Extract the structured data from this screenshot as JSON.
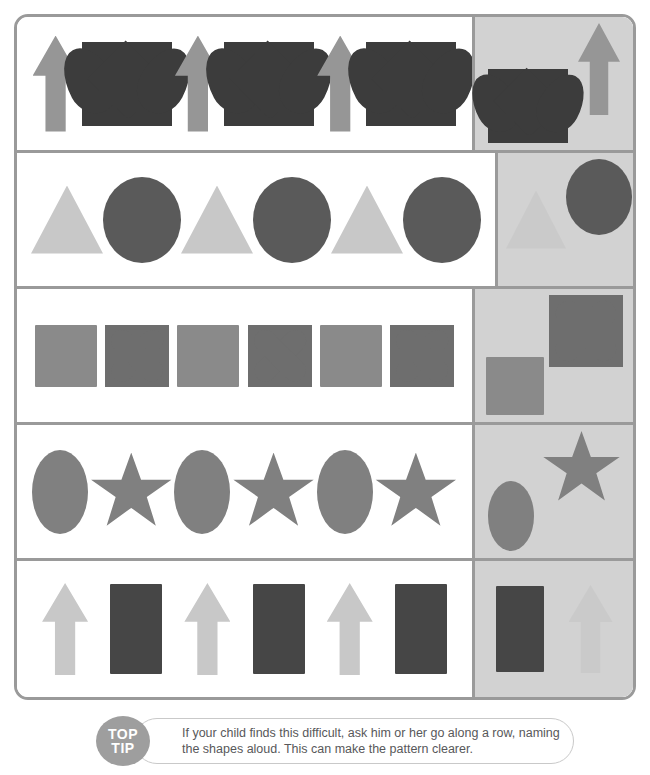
{
  "worksheet": {
    "title": "Complete the Pattern",
    "colors": {
      "border": "#9a9a9a",
      "answer_panel_bg": "#d2d2d2",
      "page_bg": "#ffffff",
      "tip_badge_bg": "#9e9e9e",
      "tip_text": "#58585a"
    },
    "rows": [
      {
        "id": "row-1",
        "pattern_name": "arrow-heart",
        "sequence": [
          {
            "shape": "arrow",
            "icon": "arrow-up-icon",
            "color": "#969696",
            "w": 46,
            "h": 96
          },
          {
            "shape": "heart",
            "icon": "heart-icon",
            "color": "#3c3c3c",
            "w": 90,
            "h": 84
          },
          {
            "shape": "arrow",
            "icon": "arrow-up-icon",
            "color": "#969696",
            "w": 46,
            "h": 96
          },
          {
            "shape": "heart",
            "icon": "heart-icon",
            "color": "#3c3c3c",
            "w": 90,
            "h": 84
          },
          {
            "shape": "arrow",
            "icon": "arrow-up-icon",
            "color": "#969696",
            "w": 46,
            "h": 96
          },
          {
            "shape": "heart",
            "icon": "heart-icon",
            "color": "#3c3c3c",
            "w": 90,
            "h": 84
          }
        ],
        "answers": [
          {
            "shape": "heart",
            "icon": "heart-icon",
            "color": "#3c3c3c",
            "w": 80,
            "h": 74,
            "ghost": false,
            "align": "flex-end"
          },
          {
            "shape": "arrow",
            "icon": "arrow-up-icon",
            "color": "#969696",
            "w": 42,
            "h": 92,
            "ghost": false,
            "align": "flex-start"
          }
        ]
      },
      {
        "id": "row-2",
        "pattern_name": "triangle-circle",
        "sequence": [
          {
            "shape": "triangle",
            "icon": "triangle-icon",
            "color": "#c8c8c8",
            "w": 72,
            "h": 68
          },
          {
            "shape": "circle",
            "icon": "circle-icon",
            "color": "#5a5a5a",
            "w": 78,
            "h": 86
          },
          {
            "shape": "triangle",
            "icon": "triangle-icon",
            "color": "#c8c8c8",
            "w": 72,
            "h": 68
          },
          {
            "shape": "circle",
            "icon": "circle-icon",
            "color": "#5a5a5a",
            "w": 78,
            "h": 86
          },
          {
            "shape": "triangle",
            "icon": "triangle-icon",
            "color": "#c8c8c8",
            "w": 72,
            "h": 68
          },
          {
            "shape": "circle",
            "icon": "circle-icon",
            "color": "#5a5a5a",
            "w": 78,
            "h": 86
          }
        ],
        "answers": [
          {
            "shape": "triangle",
            "icon": "triangle-icon",
            "color": "#8a8a8a",
            "w": 60,
            "h": 58,
            "ghost": true,
            "align": "center"
          },
          {
            "shape": "circle",
            "icon": "circle-icon",
            "color": "#5a5a5a",
            "w": 66,
            "h": 76,
            "ghost": false,
            "align": "flex-start"
          }
        ]
      },
      {
        "id": "row-3",
        "pattern_name": "square-cross",
        "sequence": [
          {
            "shape": "square",
            "icon": "square-icon",
            "color": "#8a8a8a",
            "w": 62,
            "h": 62
          },
          {
            "shape": "cross",
            "icon": "x-cross-icon",
            "color": "#6e6e6e",
            "w": 64,
            "h": 62
          },
          {
            "shape": "square",
            "icon": "square-icon",
            "color": "#8a8a8a",
            "w": 62,
            "h": 62
          },
          {
            "shape": "cross",
            "icon": "x-cross-icon",
            "color": "#6e6e6e",
            "w": 64,
            "h": 62
          },
          {
            "shape": "square",
            "icon": "square-icon",
            "color": "#8a8a8a",
            "w": 62,
            "h": 62
          },
          {
            "shape": "cross",
            "icon": "x-cross-icon",
            "color": "#6e6e6e",
            "w": 64,
            "h": 62
          }
        ],
        "answers": [
          {
            "shape": "square",
            "icon": "square-icon",
            "color": "#8a8a8a",
            "w": 58,
            "h": 58,
            "ghost": false,
            "align": "flex-end"
          },
          {
            "shape": "cross",
            "icon": "x-cross-icon",
            "color": "#6e6e6e",
            "w": 74,
            "h": 72,
            "ghost": false,
            "align": "flex-start"
          }
        ]
      },
      {
        "id": "row-4",
        "pattern_name": "oval-star",
        "sequence": [
          {
            "shape": "oval",
            "icon": "oval-icon",
            "color": "#808080",
            "w": 56,
            "h": 84
          },
          {
            "shape": "star",
            "icon": "star-icon",
            "color": "#808080",
            "w": 82,
            "h": 78
          },
          {
            "shape": "oval",
            "icon": "oval-icon",
            "color": "#808080",
            "w": 56,
            "h": 84
          },
          {
            "shape": "star",
            "icon": "star-icon",
            "color": "#808080",
            "w": 82,
            "h": 78
          },
          {
            "shape": "oval",
            "icon": "oval-icon",
            "color": "#808080",
            "w": 56,
            "h": 84
          },
          {
            "shape": "star",
            "icon": "star-icon",
            "color": "#808080",
            "w": 82,
            "h": 78
          }
        ],
        "answers": [
          {
            "shape": "oval",
            "icon": "oval-icon",
            "color": "#808080",
            "w": 46,
            "h": 70,
            "ghost": false,
            "align": "flex-end"
          },
          {
            "shape": "star",
            "icon": "star-icon",
            "color": "#808080",
            "w": 78,
            "h": 74,
            "ghost": false,
            "align": "flex-start"
          }
        ]
      },
      {
        "id": "row-5",
        "pattern_name": "arrow-rectangle",
        "sequence": [
          {
            "shape": "arrow",
            "icon": "arrow-up-icon",
            "color": "#c8c8c8",
            "w": 46,
            "h": 92
          },
          {
            "shape": "rect",
            "icon": "rectangle-icon",
            "color": "#464646",
            "w": 52,
            "h": 90
          },
          {
            "shape": "arrow",
            "icon": "arrow-up-icon",
            "color": "#c8c8c8",
            "w": 46,
            "h": 92
          },
          {
            "shape": "rect",
            "icon": "rectangle-icon",
            "color": "#464646",
            "w": 52,
            "h": 90
          },
          {
            "shape": "arrow",
            "icon": "arrow-up-icon",
            "color": "#c8c8c8",
            "w": 46,
            "h": 92
          },
          {
            "shape": "rect",
            "icon": "rectangle-icon",
            "color": "#464646",
            "w": 52,
            "h": 90
          }
        ],
        "answers": [
          {
            "shape": "rect",
            "icon": "rectangle-icon",
            "color": "#464646",
            "w": 48,
            "h": 86,
            "ghost": false,
            "align": "center"
          },
          {
            "shape": "arrow",
            "icon": "arrow-up-icon",
            "color": "#8a8a8a",
            "w": 44,
            "h": 88,
            "ghost": true,
            "align": "center"
          }
        ]
      }
    ]
  },
  "tip": {
    "badge_line1": "TOP",
    "badge_line2": "TIP",
    "text": "If your child finds this difficult, ask him or her go along a row, naming the shapes aloud. This can make the pattern clearer."
  }
}
